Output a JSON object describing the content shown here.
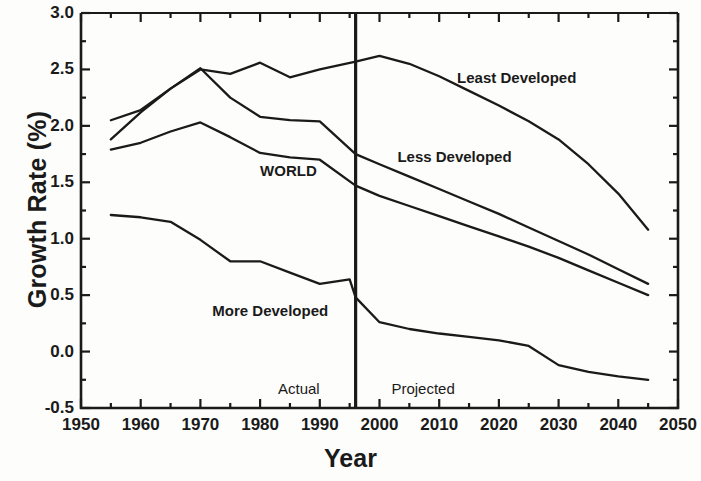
{
  "chart_data": {
    "type": "line",
    "title": "",
    "xlabel": "Year",
    "ylabel": "Growth Rate (%)",
    "xlim": [
      1950,
      2050
    ],
    "ylim": [
      -0.5,
      3.0
    ],
    "xticks": [
      1950,
      1960,
      1970,
      1980,
      1990,
      2000,
      2010,
      2020,
      2030,
      2040,
      2050
    ],
    "yticks": [
      "3.0",
      "2.5",
      "2.0",
      "1.5",
      "1.0",
      "0.5",
      "0.0",
      "-0.5"
    ],
    "ytick_values": [
      3.0,
      2.5,
      2.0,
      1.5,
      1.0,
      0.5,
      0.0,
      -0.5
    ],
    "minor_ticks": true,
    "grid": false,
    "legend": "inline-labels",
    "divider_year": 1996,
    "annotations": [
      {
        "text": "Actual",
        "x": 1983,
        "y": -0.33
      },
      {
        "text": "Projected",
        "x": 2002,
        "y": -0.33
      }
    ],
    "series": [
      {
        "name": "Least Developed",
        "label_x": 2013,
        "label_y": 2.42,
        "x": [
          1955,
          1960,
          1965,
          1970,
          1975,
          1980,
          1985,
          1990,
          1996,
          2000,
          2005,
          2010,
          2015,
          2020,
          2025,
          2030,
          2035,
          2040,
          2045
        ],
        "y": [
          1.88,
          2.12,
          2.33,
          2.5,
          2.46,
          2.56,
          2.43,
          2.5,
          2.57,
          2.62,
          2.55,
          2.44,
          2.31,
          2.18,
          2.04,
          1.88,
          1.66,
          1.4,
          1.08
        ]
      },
      {
        "name": "Less Developed",
        "label_x": 2003,
        "label_y": 1.72,
        "x": [
          1955,
          1960,
          1965,
          1970,
          1975,
          1980,
          1985,
          1990,
          1996,
          2000,
          2005,
          2010,
          2015,
          2020,
          2025,
          2030,
          2035,
          2040,
          2045
        ],
        "y": [
          2.05,
          2.14,
          2.33,
          2.51,
          2.25,
          2.08,
          2.05,
          2.04,
          1.75,
          1.66,
          1.55,
          1.44,
          1.33,
          1.22,
          1.1,
          0.98,
          0.86,
          0.73,
          0.6
        ]
      },
      {
        "name": "WORLD",
        "label_x": 1980,
        "label_y": 1.6,
        "x": [
          1955,
          1960,
          1965,
          1970,
          1975,
          1980,
          1985,
          1990,
          1996,
          2000,
          2005,
          2010,
          2015,
          2020,
          2025,
          2030,
          2035,
          2040,
          2045
        ],
        "y": [
          1.79,
          1.85,
          1.95,
          2.03,
          1.9,
          1.76,
          1.72,
          1.7,
          1.47,
          1.38,
          1.29,
          1.2,
          1.11,
          1.02,
          0.93,
          0.83,
          0.72,
          0.61,
          0.5
        ]
      },
      {
        "name": "More Developed",
        "label_x": 1972,
        "label_y": 0.36,
        "x": [
          1955,
          1960,
          1965,
          1970,
          1975,
          1980,
          1985,
          1990,
          1995,
          1996,
          2000,
          2005,
          2010,
          2015,
          2020,
          2025,
          2030,
          2035,
          2040,
          2045
        ],
        "y": [
          1.21,
          1.19,
          1.15,
          0.99,
          0.8,
          0.8,
          0.7,
          0.6,
          0.64,
          0.48,
          0.26,
          0.2,
          0.16,
          0.13,
          0.1,
          0.05,
          -0.12,
          -0.18,
          -0.22,
          -0.25
        ]
      }
    ]
  },
  "axis": {
    "y_title": "Growth Rate (%)",
    "x_title": "Year"
  }
}
